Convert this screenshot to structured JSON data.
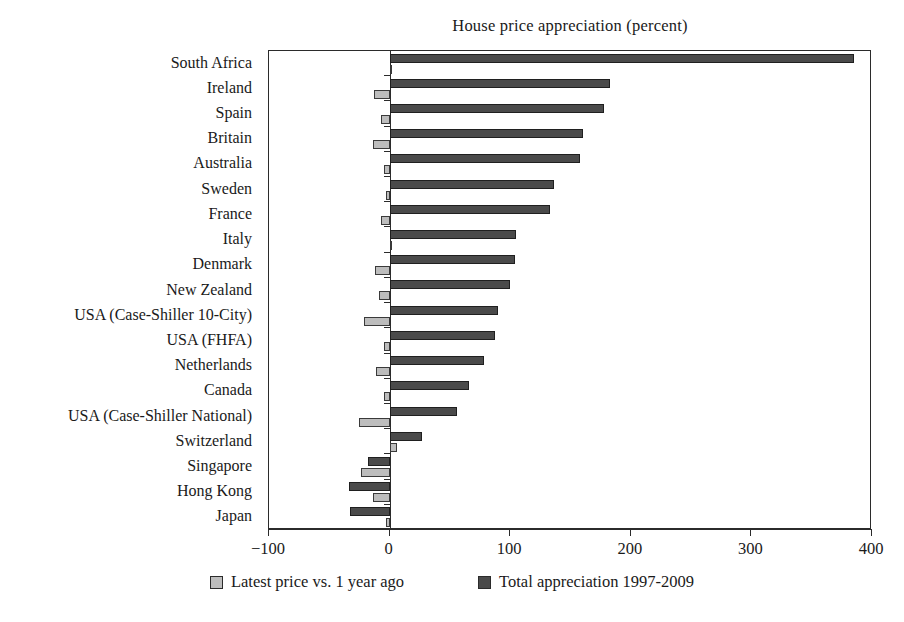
{
  "chart_data": {
    "type": "bar",
    "orientation": "horizontal",
    "title": "House price appreciation (percent)",
    "xlabel": "",
    "ylabel": "",
    "xlim": [
      -100,
      400
    ],
    "xticks": [
      -100,
      0,
      100,
      200,
      300,
      400
    ],
    "xtick_labels": [
      "−100",
      "0",
      "100",
      "200",
      "300",
      "400"
    ],
    "grid": false,
    "legend_position": "bottom",
    "categories": [
      "South Africa",
      "Ireland",
      "Spain",
      "Britain",
      "Australia",
      "Sweden",
      "France",
      "Italy",
      "Denmark",
      "New Zealand",
      "USA (Case-Shiller 10-City)",
      "USA (FHFA)",
      "Netherlands",
      "Canada",
      "USA (Case-Shiller National)",
      "Switzerland",
      "Singapore",
      "Hong Kong",
      "Japan"
    ],
    "series": [
      {
        "name": "Total appreciation 1997-2009",
        "color": "#4a4a4a",
        "values": [
          385,
          183,
          178,
          160,
          158,
          136,
          133,
          105,
          104,
          100,
          90,
          87,
          78,
          66,
          56,
          27,
          -18,
          -34,
          -33
        ]
      },
      {
        "name": "Latest price vs. 1 year ago",
        "color": "#bdbdbd",
        "values": [
          2,
          -13,
          -7,
          -14,
          -5,
          -3,
          -7,
          1,
          -12,
          -9,
          -21,
          -5,
          -11,
          -5,
          -25,
          6,
          -24,
          -14,
          -3
        ]
      }
    ]
  },
  "legend": {
    "entries": [
      {
        "label": "Latest price vs. 1 year ago",
        "swatch": "light"
      },
      {
        "label": "Total appreciation 1997-2009",
        "swatch": "dark"
      }
    ]
  }
}
